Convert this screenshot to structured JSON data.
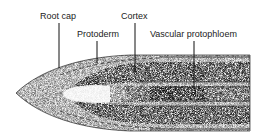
{
  "diagram": {
    "labels": [
      {
        "id": "root-cap",
        "text": "Root cap"
      },
      {
        "id": "cortex",
        "text": "Cortex"
      },
      {
        "id": "protoderm",
        "text": "Protoderm"
      },
      {
        "id": "vascular-protophloem",
        "text": "Vascular protophloem"
      }
    ]
  }
}
